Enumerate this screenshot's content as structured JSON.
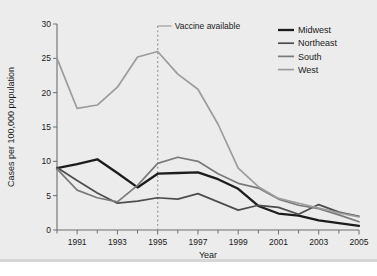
{
  "chart_data": {
    "type": "line",
    "title": "",
    "xlabel": "Year",
    "ylabel": "Cases per 100,000 population",
    "xlim": [
      1990,
      2005
    ],
    "ylim": [
      0,
      30
    ],
    "grid": false,
    "legend_position": "top-right",
    "x": [
      1990,
      1991,
      1992,
      1993,
      1994,
      1995,
      1996,
      1997,
      1998,
      1999,
      2000,
      2001,
      2002,
      2003,
      2004,
      2005
    ],
    "xticks": [
      1991,
      1993,
      1995,
      1997,
      1999,
      2001,
      2003,
      2005
    ],
    "xtick_labels": [
      "1991",
      "1993",
      "1995",
      "1997",
      "1999",
      "2001",
      "2003",
      "2005"
    ],
    "xminorticks": [
      1990,
      1992,
      1994,
      1996,
      1998,
      2000,
      2002,
      2004
    ],
    "yticks": [
      0,
      5,
      10,
      15,
      20,
      25,
      30
    ],
    "ytick_labels": [
      "0",
      "5",
      "10",
      "15",
      "20",
      "25",
      "30"
    ],
    "series": [
      {
        "name": "Midwest",
        "color": "#1c1c1c",
        "width": 2.3,
        "values": [
          9.0,
          9.6,
          10.3,
          8.3,
          6.2,
          8.2,
          8.3,
          8.4,
          7.4,
          6.0,
          3.5,
          2.4,
          2.1,
          1.4,
          1.0,
          0.6
        ]
      },
      {
        "name": "Northeast",
        "color": "#4d4d4d",
        "width": 1.7,
        "values": [
          9.1,
          7.2,
          5.4,
          3.9,
          4.2,
          4.7,
          4.5,
          5.3,
          4.1,
          2.9,
          3.6,
          3.3,
          2.3,
          3.7,
          2.6,
          2.0
        ]
      },
      {
        "name": "South",
        "color": "#7a7a7a",
        "width": 1.7,
        "values": [
          8.9,
          5.8,
          4.7,
          4.1,
          6.5,
          9.7,
          10.6,
          10.0,
          8.2,
          6.8,
          6.1,
          4.5,
          3.6,
          3.1,
          2.2,
          1.2
        ]
      },
      {
        "name": "West",
        "color": "#9c9c9c",
        "width": 1.7,
        "values": [
          25.0,
          17.7,
          18.2,
          20.8,
          25.2,
          26.0,
          22.7,
          20.5,
          15.4,
          9.0,
          6.3,
          4.6,
          3.9,
          3.2,
          2.5,
          1.9
        ]
      }
    ],
    "annotations": [
      {
        "label": "Vaccine available",
        "x": 1995,
        "style": "dashed-vertical-line",
        "color": "#9a9a9a"
      }
    ]
  },
  "legend": {
    "items": [
      {
        "label": "Midwest"
      },
      {
        "label": "Northeast"
      },
      {
        "label": "South"
      },
      {
        "label": "West"
      }
    ]
  }
}
